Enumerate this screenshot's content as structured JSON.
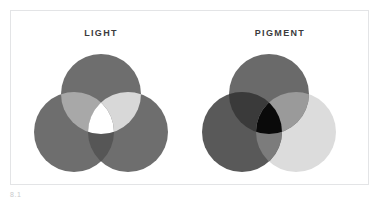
{
  "figure": {
    "caption": "8.1",
    "background_color": "#ffffff",
    "frame_color": "#e3e4e6",
    "title_color": "#3b3b3d"
  },
  "panels": [
    {
      "id": "light",
      "title": "LIGHT",
      "model": "additive",
      "center_label": "white",
      "center_color": "#ffffff",
      "circles": [
        {
          "name": "top-circle",
          "fill": "#6e6e6e",
          "cx": 80,
          "cy": 45,
          "r": 40
        },
        {
          "name": "bottom-left-circle",
          "fill": "#6e6e6e",
          "cx": 53,
          "cy": 83,
          "r": 40
        },
        {
          "name": "bottom-right-circle",
          "fill": "#6e6e6e",
          "cx": 107,
          "cy": 83,
          "r": 40
        }
      ],
      "overlaps": [
        {
          "name": "top-left-overlap",
          "fill": "#a8a8a8"
        },
        {
          "name": "top-right-overlap",
          "fill": "#d8d8d8"
        },
        {
          "name": "bottom-overlap",
          "fill": "#565656"
        },
        {
          "name": "center-overlap",
          "fill": "#ffffff"
        }
      ]
    },
    {
      "id": "pigment",
      "title": "PIGMENT",
      "model": "subtractive",
      "center_label": "black",
      "center_color": "#0a0a0a",
      "circles": [
        {
          "name": "top-circle",
          "fill": "#6a6a6a",
          "cx": 80,
          "cy": 45,
          "r": 40
        },
        {
          "name": "bottom-left-circle",
          "fill": "#595959",
          "cx": 53,
          "cy": 83,
          "r": 40
        },
        {
          "name": "bottom-right-circle",
          "fill": "#dcdcdc",
          "cx": 107,
          "cy": 83,
          "r": 40
        }
      ],
      "overlaps": [
        {
          "name": "top-left-overlap",
          "fill": "#3a3a3a"
        },
        {
          "name": "top-right-overlap",
          "fill": "#9a9a9a"
        },
        {
          "name": "bottom-overlap",
          "fill": "#7c7c7c"
        },
        {
          "name": "center-overlap",
          "fill": "#0a0a0a"
        }
      ]
    }
  ]
}
